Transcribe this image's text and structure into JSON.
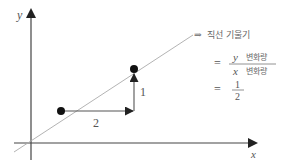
{
  "diagram": {
    "title": "직선 기울기",
    "axes": {
      "x_label": "x",
      "y_label": "y"
    },
    "points": [
      {
        "name": "A",
        "x": 61,
        "y": 111
      },
      {
        "name": "B",
        "x": 134,
        "y": 69
      }
    ],
    "run": {
      "label": "2"
    },
    "rise": {
      "label": "1"
    },
    "annotation": {
      "arrow": "⇒",
      "text": "직선 기울기"
    },
    "formula": {
      "eq1": "=",
      "numerator_var": "y",
      "numerator_text": "변화량",
      "denominator_var": "x",
      "denominator_text": "변화량",
      "eq2": "=",
      "result_numerator": "1",
      "result_denominator": "2"
    },
    "colors": {
      "axis": "#333333",
      "line": "#aaaaaa",
      "point": "#111111",
      "arrow": "#444444",
      "text": "#555555"
    }
  }
}
